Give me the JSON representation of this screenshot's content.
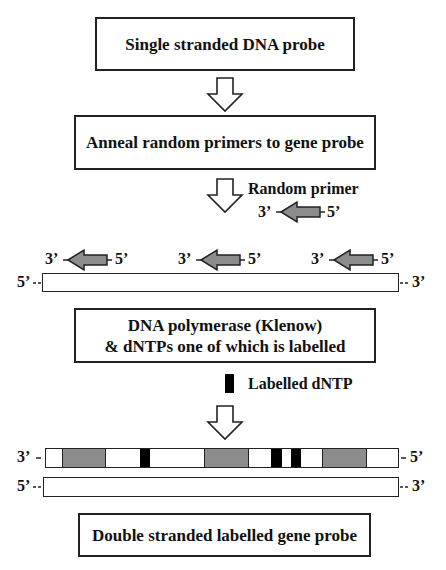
{
  "diagram": {
    "steps": [
      {
        "label": "Single stranded DNA probe"
      },
      {
        "label": "Anneal random primers to gene probe"
      },
      {
        "label_line1": "DNA polymerase (Klenow)",
        "label_line2": "& dNTPs one of which is labelled"
      },
      {
        "label": "Double stranded labelled gene probe"
      }
    ],
    "legend": {
      "random_primer": {
        "label": "Random primer",
        "left_end": "3’",
        "right_end": "5’"
      },
      "labelled_dntp": {
        "label": "Labelled dNTP"
      }
    },
    "annealed": {
      "primers": [
        {
          "left_end": "3’",
          "right_end": "5’"
        },
        {
          "left_end": "3’",
          "right_end": "5’"
        },
        {
          "left_end": "3’",
          "right_end": "5’"
        }
      ],
      "template_strand": {
        "left_end": "5’",
        "right_end": "3’"
      }
    },
    "product": {
      "new_strand": {
        "left_end": "3’",
        "right_end": "5’",
        "segments": [
          {
            "type": "primer",
            "x0": 62,
            "x1": 103
          },
          {
            "type": "labelled",
            "x0": 140,
            "x1": 149
          },
          {
            "type": "primer",
            "x0": 204,
            "x1": 246
          },
          {
            "type": "labelled",
            "x0": 271,
            "x1": 281
          },
          {
            "type": "labelled",
            "x0": 291,
            "x1": 300
          },
          {
            "type": "primer",
            "x0": 322,
            "x1": 364
          }
        ]
      },
      "template_strand": {
        "left_end": "5’",
        "right_end": "3’"
      }
    },
    "colors": {
      "primer_fill": "#8c8c8c",
      "labelled_fill": "#000000",
      "outline": "#222222",
      "background": "#ffffff"
    }
  }
}
